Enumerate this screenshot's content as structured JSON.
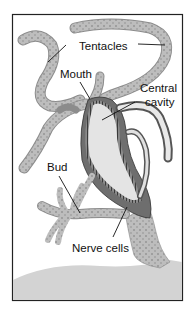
{
  "figure": {
    "labels": {
      "tentacles": "Tentacles",
      "mouth": "Mouth",
      "central_cavity_line1": "Central",
      "central_cavity_line2": "cavity",
      "bud": "Bud",
      "nerve_cells": "Nerve cells"
    },
    "colors": {
      "body": "#b9b9b9",
      "cavity": "#e4e4e4",
      "dark_wall": "#6f6f6f",
      "ground": "#d2d2d2",
      "frame": "#222222",
      "dots": "#7a7a7a"
    }
  }
}
